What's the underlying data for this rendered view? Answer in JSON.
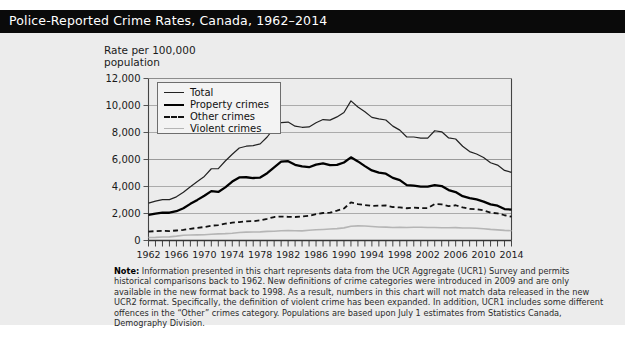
{
  "header": {
    "title": "Police-Reported Crime Rates, Canada, 1962–2014"
  },
  "axis_caption": "Rate per 100,000\npopulation",
  "legend": {
    "items": [
      {
        "label": "Total",
        "style": "solid-thin",
        "color": "#222222"
      },
      {
        "label": "Property crimes",
        "style": "solid-thick",
        "color": "#000000"
      },
      {
        "label": "Other crimes",
        "style": "dashed",
        "color": "#111111"
      },
      {
        "label": "Violent crimes",
        "style": "solid-light",
        "color": "#b5b5b5"
      }
    ]
  },
  "note": {
    "label": "Note:",
    "text": " Information presented in this chart represents data from the UCR Aggregate (UCR1) Survey and permits historical comparisons back to 1962. New definitions of crime categories were introduced in 2009 and are only available in the new format back to 1998. As a result, numbers in this chart will not match data released in the new UCR2 format. Specifically, the definition of violent crime has been expanded. In addition, UCR1 includes some different offences in the “Other” crimes category. Populations are based upon July 1 estimates from Statistics Canada, Demography Division."
  },
  "colors": {
    "title_band": "#0a0a0a",
    "title_text": "#ffffff",
    "panel_bg": "#ececec",
    "page_bg": "#ffffff",
    "grid": "#9a9a9a",
    "axis": "#555555"
  },
  "chart_data": {
    "type": "line",
    "title": "Police-Reported Crime Rates, Canada, 1962–2014",
    "xlabel": "",
    "ylabel": "Rate per 100,000 population",
    "ylim": [
      0,
      12000
    ],
    "xlim": [
      1962,
      2014
    ],
    "yticks": [
      0,
      2000,
      4000,
      6000,
      8000,
      10000,
      12000
    ],
    "ytick_labels": [
      "0",
      "2,000",
      "4,000",
      "6,000",
      "8,000",
      "10,000",
      "12,000"
    ],
    "xticks": [
      1962,
      1966,
      1970,
      1974,
      1978,
      1982,
      1986,
      1990,
      1994,
      1998,
      2002,
      2006,
      2010,
      2014
    ],
    "xtick_labels": [
      "1962",
      "1966",
      "1970",
      "1974",
      "1978",
      "1982",
      "1986",
      "1990",
      "1994",
      "1998",
      "2002",
      "2006",
      "2010",
      "2014"
    ],
    "minor_xtick_interval": 1,
    "grid": "horizontal",
    "legend_position": "upper-left-inside",
    "x": [
      1962,
      1963,
      1964,
      1965,
      1966,
      1967,
      1968,
      1969,
      1970,
      1971,
      1972,
      1973,
      1974,
      1975,
      1976,
      1977,
      1978,
      1979,
      1980,
      1981,
      1982,
      1983,
      1984,
      1985,
      1986,
      1987,
      1988,
      1989,
      1990,
      1991,
      1992,
      1993,
      1994,
      1995,
      1996,
      1997,
      1998,
      1999,
      2000,
      2001,
      2002,
      2003,
      2004,
      2005,
      2006,
      2007,
      2008,
      2009,
      2010,
      2011,
      2012,
      2013,
      2014
    ],
    "series": [
      {
        "name": "Total",
        "values": [
          2771,
          2915,
          3033,
          3025,
          3232,
          3570,
          3987,
          4368,
          4744,
          5313,
          5330,
          5887,
          6388,
          6852,
          6984,
          7028,
          7154,
          7666,
          8343,
          8736,
          8773,
          8470,
          8387,
          8413,
          8727,
          8959,
          8919,
          9154,
          9486,
          10342,
          9891,
          9538,
          9120,
          9007,
          8927,
          8472,
          8175,
          7666,
          7666,
          7590,
          7590,
          8132,
          8051,
          7596,
          7518,
          6984,
          6588,
          6406,
          6145,
          5757,
          5588,
          5190,
          5046
        ]
      },
      {
        "name": "Property crimes",
        "values": [
          1891,
          1988,
          2060,
          2056,
          2168,
          2389,
          2714,
          3009,
          3320,
          3658,
          3598,
          3938,
          4366,
          4671,
          4686,
          4628,
          4662,
          4983,
          5422,
          5838,
          5876,
          5607,
          5486,
          5429,
          5619,
          5713,
          5588,
          5596,
          5781,
          6160,
          5860,
          5509,
          5189,
          5026,
          4951,
          4639,
          4475,
          4106,
          4061,
          3990,
          3987,
          4107,
          4033,
          3738,
          3588,
          3285,
          3144,
          3042,
          2883,
          2677,
          2579,
          2331,
          2290
        ]
      },
      {
        "name": "Other crimes",
        "values": [
          659,
          693,
          713,
          700,
          740,
          788,
          869,
          939,
          998,
          1096,
          1139,
          1242,
          1320,
          1367,
          1421,
          1431,
          1493,
          1610,
          1740,
          1773,
          1756,
          1742,
          1785,
          1824,
          1955,
          2036,
          2063,
          2207,
          2370,
          2828,
          2700,
          2620,
          2570,
          2580,
          2600,
          2480,
          2450,
          2390,
          2430,
          2400,
          2400,
          2700,
          2680,
          2540,
          2610,
          2450,
          2340,
          2318,
          2230,
          2060,
          2010,
          1870,
          1760
        ]
      },
      {
        "name": "Violent crimes",
        "values": [
          221,
          234,
          260,
          269,
          324,
          393,
          404,
          420,
          426,
          459,
          493,
          507,
          542,
          594,
          617,
          629,
          639,
          673,
          681,
          725,
          741,
          721,
          716,
          760,
          793,
          820,
          848,
          881,
          935,
          1060,
          1081,
          1072,
          1038,
          995,
          992,
          962,
          977,
          960,
          984,
          984,
          965,
          963,
          946,
          943,
          951,
          930,
          924,
          909,
          871,
          824,
          790,
          750,
          724
        ]
      }
    ]
  }
}
